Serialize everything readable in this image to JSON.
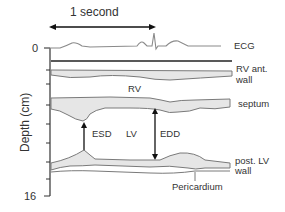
{
  "diagram": {
    "type": "M-mode echocardiogram schematic",
    "time_scale": {
      "label": "1 second"
    },
    "y_axis": {
      "label": "Depth (cm)",
      "tick_top": "0",
      "tick_bottom": "16"
    },
    "traces": {
      "ecg": "ECG",
      "rv_wall_line1": "RV ant.",
      "rv_wall_line2": "wall",
      "septum": "septum",
      "post_lv_line1": "post. LV",
      "post_lv_line2": "wall",
      "pericardium": "Pericardium"
    },
    "chambers": {
      "rv": "RV",
      "lv": "LV"
    },
    "measurements": {
      "esd": "ESD",
      "edd": "EDD"
    },
    "colors": {
      "trace_stroke": "#7a7a7a",
      "fill": "#e6e6e6",
      "axis": "#333333",
      "arrow": "#111111"
    }
  }
}
